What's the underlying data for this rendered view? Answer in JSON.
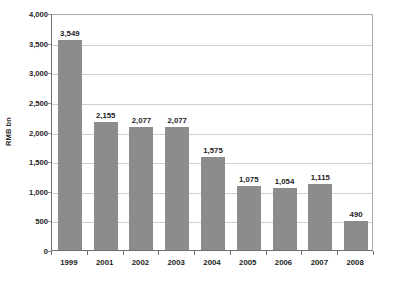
{
  "chart_data": {
    "type": "bar",
    "title": "",
    "subtitle": "",
    "xlabel": "",
    "ylabel": "RMB bn",
    "categories": [
      "1999",
      "2001",
      "2002",
      "2003",
      "2004",
      "2005",
      "2006",
      "2007",
      "2008"
    ],
    "values": [
      3549,
      2155,
      2077,
      2077,
      1575,
      1075,
      1054,
      1115,
      490
    ],
    "data_labels": [
      "3,549",
      "2,155",
      "2,077",
      "2,077",
      "1,575",
      "1,075",
      "1,054",
      "1,115",
      "490"
    ],
    "ylim": [
      0,
      4000
    ],
    "y_ticks": [
      0,
      500,
      1000,
      1500,
      2000,
      2500,
      3000,
      3500,
      4000
    ],
    "y_tick_labels": [
      "0",
      "500",
      "1,000",
      "1,500",
      "2,000",
      "2,500",
      "3,000",
      "3,500",
      "4,000"
    ],
    "grid": true,
    "grid_axis": "y",
    "legend": false,
    "legend_position": "none",
    "series": [
      {
        "name": "RMB bn",
        "values": [
          3549,
          2155,
          2077,
          2077,
          1575,
          1075,
          1054,
          1115,
          490
        ]
      }
    ],
    "colors": {
      "bar": "#8c8c8c",
      "gridline": "#cfcfcf",
      "axis": "#6f6f6f",
      "plot_border": "#a9a9a9",
      "text": "#1d1d1d",
      "background": "#ffffff"
    }
  }
}
